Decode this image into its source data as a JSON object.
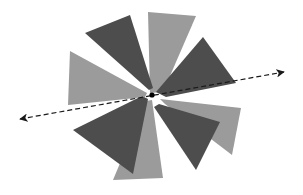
{
  "figure": {
    "type": "geometric-diagram",
    "canvas": {
      "width": 303,
      "height": 195
    },
    "background_color": "#ffffff",
    "colors": {
      "dark_wedge": "#4d4d4d",
      "light_wedge": "#9b9b9b",
      "axis_line": "#1a1a1a",
      "center_dot": "#000000",
      "background": "#ffffff"
    },
    "center_point": {
      "x": 152,
      "y": 95,
      "label": ""
    },
    "wedge_count": 8,
    "wedges": [
      {
        "name": "wedge-n-light",
        "color_key": "light_wedge",
        "points": "150,93 148,12 196,16 163,92"
      },
      {
        "name": "wedge-ne-dark",
        "color_key": "dark_wedge",
        "points": "156,92 203,37 236,83 166,97"
      },
      {
        "name": "wedge-e-light",
        "color_key": "light_wedge",
        "points": "160,99 241,108 232,155 165,104"
      },
      {
        "name": "wedge-se-dark",
        "color_key": "dark_wedge",
        "points": "159,104 220,122 196,170 154,107"
      },
      {
        "name": "wedge-s-light",
        "color_key": "light_wedge",
        "points": "152,100 163,178 113,180 146,101"
      },
      {
        "name": "wedge-sw-dark",
        "color_key": "dark_wedge",
        "points": "148,99 133,174 73,130 142,96"
      },
      {
        "name": "wedge-w-light",
        "color_key": "light_wedge",
        "points": "147,93 70,51 68,105 145,97"
      },
      {
        "name": "wedge-nw-dark",
        "color_key": "dark_wedge",
        "points": "149,90 85,33 130,15 153,88"
      }
    ],
    "axis": {
      "name": "axis-of-symmetry",
      "style": "dashed double-headed arrow",
      "start": {
        "x": 20,
        "y": 119
      },
      "end": {
        "x": 284,
        "y": 72
      },
      "dash_pattern": "5,3",
      "stroke_width": 1.2,
      "arrowheads": [
        "start",
        "end"
      ]
    }
  }
}
